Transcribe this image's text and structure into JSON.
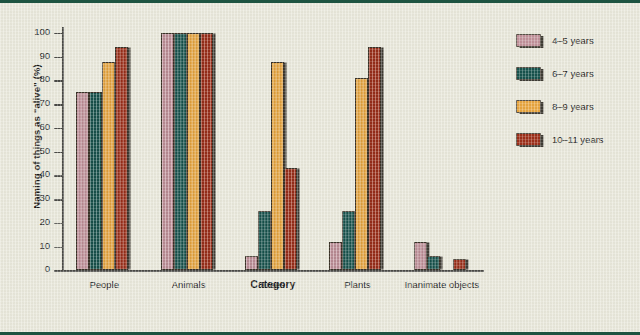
{
  "figure": {
    "frame_color": "#1d5340",
    "background_color": "#e9e8db"
  },
  "chart_data": {
    "type": "bar",
    "title": "",
    "xlabel": "Category",
    "ylabel": "Naming of things as “alive” (%)",
    "categories": [
      "People",
      "Animals",
      "Trees",
      "Plants",
      "Inanimate objects"
    ],
    "ylim": [
      0,
      100
    ],
    "yticks": [
      0,
      10,
      20,
      30,
      40,
      50,
      60,
      70,
      80,
      90,
      100
    ],
    "ytick_labels": [
      "0",
      "10",
      "20",
      "30",
      "40",
      "50",
      "60",
      "70",
      "80",
      "90",
      "100"
    ],
    "grid": false,
    "legend_position": "right",
    "series": [
      {
        "name": "4–5 years",
        "color": "#c1919a",
        "values": [
          75,
          100,
          6,
          12,
          12
        ]
      },
      {
        "name": "6–7 years",
        "color": "#17534d",
        "values": [
          75,
          100,
          25,
          25,
          6
        ]
      },
      {
        "name": "8–9 years",
        "color": "#e9a63f",
        "values": [
          88,
          100,
          88,
          81,
          0
        ]
      },
      {
        "name": "10–11 years",
        "color": "#9d2f19",
        "values": [
          94,
          100,
          43,
          94,
          5
        ]
      }
    ]
  }
}
